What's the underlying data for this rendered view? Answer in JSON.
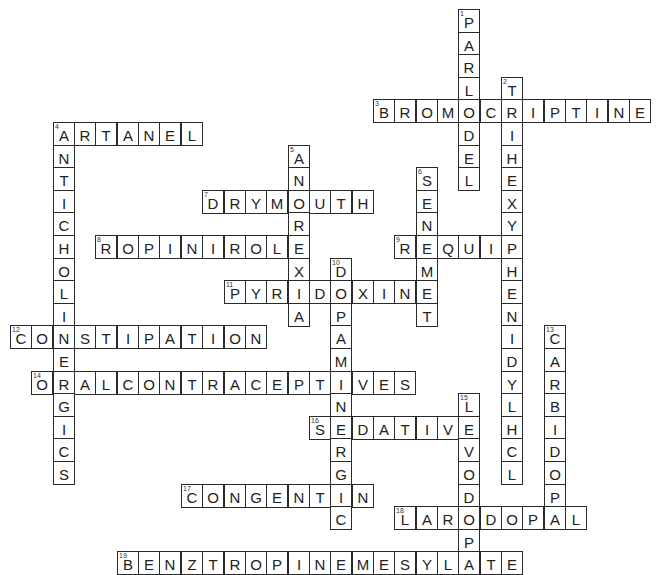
{
  "puzzle": {
    "grid": {
      "origin_x": 10,
      "origin_y": 9,
      "cell_w": 21.35,
      "cell_h": 22.6,
      "cols": 30,
      "rows": 25
    },
    "colors": {
      "border": "#2a2a2a",
      "text": "#222222",
      "background": "#ffffff"
    },
    "words": [
      {
        "number": 1,
        "answer": "PARLODEL",
        "direction": "down",
        "row": 0,
        "col": 21
      },
      {
        "number": 2,
        "answer": "TRIHEXYPHENIDYLHCL",
        "direction": "down",
        "row": 3,
        "col": 23
      },
      {
        "number": 3,
        "answer": "BROMOCRIPTINE",
        "direction": "across",
        "row": 4,
        "col": 17
      },
      {
        "number": 4,
        "answer": "ARTANEL",
        "direction": "across",
        "row": 5,
        "col": 2
      },
      {
        "number": 4,
        "answer": "ANTICHOLINERGICS",
        "direction": "down",
        "row": 5,
        "col": 2
      },
      {
        "number": 5,
        "answer": "ANOREXIA",
        "direction": "down",
        "row": 6,
        "col": 13
      },
      {
        "number": 6,
        "answer": "SENEMET",
        "direction": "down",
        "row": 7,
        "col": 19
      },
      {
        "number": 7,
        "answer": "DRYMOUTH",
        "direction": "across",
        "row": 8,
        "col": 9
      },
      {
        "number": 8,
        "answer": "ROPINIROLE",
        "direction": "across",
        "row": 10,
        "col": 4
      },
      {
        "number": 9,
        "answer": "REQUIP",
        "direction": "across",
        "row": 10,
        "col": 18
      },
      {
        "number": 10,
        "answer": "DOPAMINERGIC",
        "direction": "down",
        "row": 11,
        "col": 15
      },
      {
        "number": 11,
        "answer": "PYRIDOXINE",
        "direction": "across",
        "row": 12,
        "col": 10
      },
      {
        "number": 12,
        "answer": "CONSTIPATION",
        "direction": "across",
        "row": 14,
        "col": 0
      },
      {
        "number": 13,
        "answer": "CARBIDOPA",
        "direction": "down",
        "row": 14,
        "col": 25
      },
      {
        "number": 14,
        "answer": "ORALCONTRACEPTIVES",
        "direction": "across",
        "row": 16,
        "col": 1
      },
      {
        "number": 15,
        "answer": "LEVODOPA",
        "direction": "down",
        "row": 17,
        "col": 21
      },
      {
        "number": 16,
        "answer": "SEDATIVE",
        "direction": "across",
        "row": 18,
        "col": 14
      },
      {
        "number": 17,
        "answer": "CONGENTIN",
        "direction": "across",
        "row": 21,
        "col": 8
      },
      {
        "number": 18,
        "answer": "LARODOPAL",
        "direction": "across",
        "row": 22,
        "col": 18
      },
      {
        "number": 19,
        "answer": "BENZTROPINEMESYLATE",
        "direction": "across",
        "row": 24,
        "col": 5
      }
    ]
  }
}
